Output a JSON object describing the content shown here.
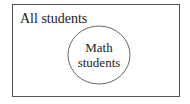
{
  "diagram": {
    "type": "venn",
    "outer_set": {
      "label": "All students"
    },
    "inner_set": {
      "label_line1": "Math",
      "label_line2": "students"
    },
    "colors": {
      "stroke": "#555555",
      "text": "#222222",
      "background": "#ffffff"
    }
  }
}
